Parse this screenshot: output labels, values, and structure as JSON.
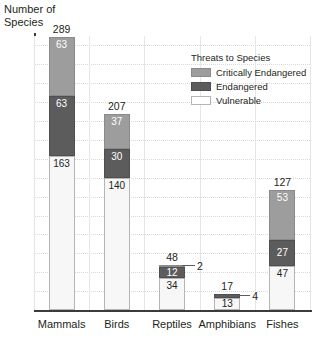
{
  "chart_data": {
    "type": "bar",
    "stacked": true,
    "title": "",
    "xlabel": "",
    "ylabel": "Number of\nSpecies",
    "ylim": [
      0,
      290
    ],
    "ytick_step": 20,
    "yticks": [
      20,
      40,
      60,
      80,
      100,
      120,
      140,
      160,
      180,
      200,
      220,
      240,
      260,
      280
    ],
    "grid": true,
    "legend_position": "inside-top-right",
    "categories": [
      "Mammals",
      "Birds",
      "Reptiles",
      "Amphibians",
      "Fishes"
    ],
    "series": [
      {
        "name": "Vulnerable",
        "color": "#f7f7f7",
        "values": [
          163,
          140,
          34,
          13,
          47
        ]
      },
      {
        "name": "Endangered",
        "color": "#5c5c5c",
        "values": [
          63,
          30,
          12,
          4,
          27
        ]
      },
      {
        "name": "Critically Endangered",
        "color": "#9d9d9d",
        "values": [
          63,
          37,
          2,
          0,
          53
        ]
      }
    ],
    "totals": [
      289,
      207,
      48,
      17,
      127
    ],
    "callouts": [
      {
        "category": "Reptiles",
        "value": "2"
      },
      {
        "category": "Amphibians",
        "value": "4"
      }
    ]
  },
  "legend": {
    "title": "Threats to Species",
    "items": [
      {
        "label": "Critically Endangered",
        "swatch": "crit"
      },
      {
        "label": "Endangered",
        "swatch": "endg"
      },
      {
        "label": "Vulnerable",
        "swatch": "vuln"
      }
    ]
  },
  "axis": {
    "y_title": "Number of\nSpecies"
  }
}
